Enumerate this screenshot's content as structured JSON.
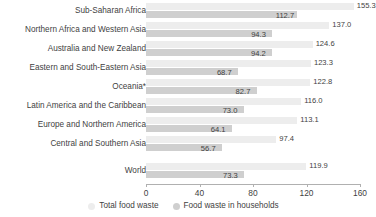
{
  "chart_data": {
    "type": "bar",
    "title": "",
    "subtitle": "",
    "xlabel": "",
    "ylabel": "",
    "orientation": "horizontal",
    "grid": false,
    "legend_position": "bottom",
    "xlim": [
      0,
      160
    ],
    "xticks": [
      0,
      40,
      80,
      120,
      160
    ],
    "xtick_labels": [
      "0",
      "40",
      "80",
      "120",
      "160"
    ],
    "categories": [
      "Sub-Saharan Africa",
      "Northern Africa and Western Asia",
      "Australia and New Zealand",
      "Eastern and South-Eastern Asia",
      "Oceania*",
      "Latin America and the Caribbean",
      "Europe and Northern America",
      "Central and Southern Asia",
      "World"
    ],
    "series": [
      {
        "name": "Total food waste",
        "color": "#ededed",
        "values": [
          155.3,
          137.0,
          124.6,
          123.3,
          122.8,
          116.0,
          113.1,
          97.4,
          119.9
        ],
        "labels": [
          "155.3",
          "137.0",
          "124.6",
          "123.3",
          "122.8",
          "116.0",
          "113.1",
          "97.4",
          "119.9"
        ]
      },
      {
        "name": "Food waste in households",
        "color": "#cfcfcf",
        "values": [
          112.7,
          94.3,
          94.2,
          68.7,
          82.7,
          73.0,
          64.1,
          56.7,
          73.3
        ],
        "labels": [
          "112.7",
          "94.3",
          "94.2",
          "68.7",
          "82.7",
          "73.0",
          "64.1",
          "56.7",
          "73.3"
        ]
      }
    ]
  },
  "legend": {
    "items": [
      {
        "label": "Total food waste",
        "color": "#ededed"
      },
      {
        "label": "Food waste in households",
        "color": "#cfcfcf"
      }
    ]
  }
}
